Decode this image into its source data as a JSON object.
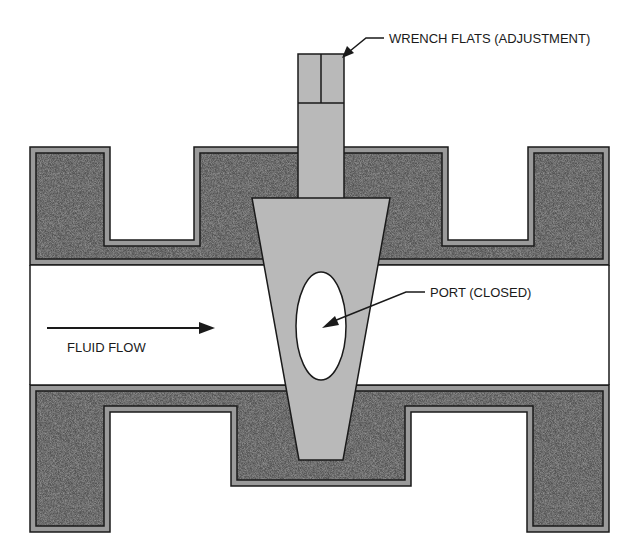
{
  "diagram": {
    "type": "plug-valve-cross-section",
    "labels": {
      "wrench_flats": "WRENCH FLATS (ADJUSTMENT)",
      "port": "PORT (CLOSED)",
      "fluid_flow": "FLUID FLOW"
    },
    "colors": {
      "body_fill": "#4f4f4f",
      "body_band": "#9a9a9a",
      "outline": "#1a1a1a",
      "plug_fill": "#b9b9b9",
      "bore_fill": "#ffffff",
      "background": "#ffffff"
    },
    "components": [
      {
        "name": "valve-body-upper",
        "description": "Upper body casting with flanges"
      },
      {
        "name": "valve-body-lower",
        "description": "Lower body casting with flanges"
      },
      {
        "name": "bore",
        "description": "Flow passage"
      },
      {
        "name": "tapered-plug",
        "description": "Tapered rotating plug"
      },
      {
        "name": "stem",
        "description": "Stem with wrench flats"
      },
      {
        "name": "port",
        "description": "Elliptical port through plug, shown closed"
      }
    ]
  }
}
